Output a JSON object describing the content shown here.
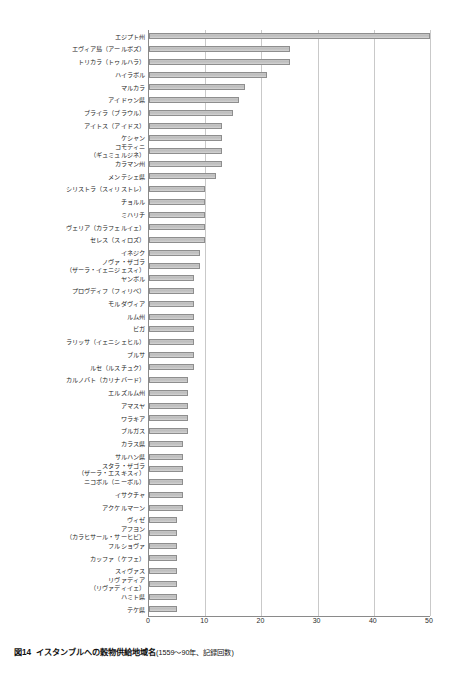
{
  "figure": {
    "number": "図14",
    "title": "イスタンブルへの穀物供給地域名",
    "subtitle": "(1559～90年、記録回数)"
  },
  "axis": {
    "ticks": [
      "0",
      "10",
      "20",
      "30",
      "40",
      "50"
    ]
  },
  "chart_data": {
    "type": "bar",
    "orientation": "horizontal",
    "xlabel": "記録回数",
    "ylabel": "",
    "xlim": [
      0,
      50
    ],
    "xticks": [
      0,
      10,
      20,
      30,
      40,
      50
    ],
    "grid": "vertical",
    "legend": "none",
    "categories": [
      "エジプト州",
      "エヴィア島（アールボズ）",
      "トリカラ（トゥルハラ）",
      "ハイラボル",
      "マルカラ",
      "アイドゥン県",
      "ブライラ（ブラウル）",
      "アイトス（アイドス）",
      "ケシャン",
      "コモティニ\n（ギュミュルジネ）",
      "カラマン州",
      "メンテシェ県",
      "シリストラ（スィリストレ）",
      "チョルル",
      "ミハリチ",
      "ヴェリア（カラフェルイェ）",
      "セレス（スィロズ）",
      "イネジク",
      "ノヴァ・ザゴラ\n（ザーラ・イェニジェスィ）",
      "ヤンボル",
      "プロヴディフ（フィリベ）",
      "モルダヴィア",
      "ルム州",
      "ビガ",
      "ラリッサ（イェニシェヒル）",
      "ブルサ",
      "ルセ（ルスチュク）",
      "カルノバト（カリナバード）",
      "エルズルム州",
      "アマスヤ",
      "ワラキア",
      "ブルガス",
      "カラス県",
      "サルハン県",
      "スタラ・ザゴラ\n（ザーラ・エスキスィ）",
      "ニコボル（ニーボル）",
      "イサクチャ",
      "アクケルマーン",
      "ヴィゼ",
      "アフヨン\n（カラヒサール・サーヒビ）",
      "フルショヴァ",
      "カッファ（ケフェ）",
      "スィヴァス",
      "リヴァディア\n（リヴァディイェ）",
      "ハミト県",
      "テケ県"
    ],
    "values": [
      50,
      25,
      25,
      21,
      17,
      16,
      15,
      13,
      13,
      13,
      13,
      12,
      10,
      10,
      10,
      10,
      10,
      9,
      9,
      8,
      8,
      8,
      8,
      8,
      8,
      8,
      8,
      7,
      7,
      7,
      7,
      7,
      6,
      6,
      6,
      6,
      6,
      6,
      5,
      5,
      5,
      5,
      5,
      5,
      5,
      5
    ]
  }
}
